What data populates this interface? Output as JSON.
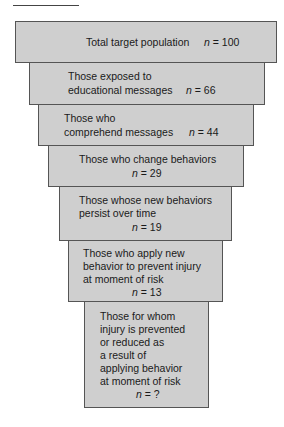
{
  "diagram": {
    "type": "funnel",
    "colors": {
      "box_fill": "#cfcfcf",
      "box_border": "#555555",
      "text": "#1a1a1a"
    },
    "stages": [
      {
        "label": "Total target population",
        "n_symbol": "n",
        "n_value": "= 100"
      },
      {
        "label_lines": [
          "Those exposed to",
          "educational messages"
        ],
        "n_symbol": "n",
        "n_value": "= 66"
      },
      {
        "label_lines": [
          "Those who",
          "comprehend messages"
        ],
        "n_symbol": "n",
        "n_value": "= 44"
      },
      {
        "label": "Those who change behaviors",
        "n_symbol": "n",
        "n_value": "= 29"
      },
      {
        "label_lines": [
          "Those whose new behaviors",
          "persist over time"
        ],
        "n_symbol": "n",
        "n_value": "= 19"
      },
      {
        "label_lines": [
          "Those who apply new",
          "behavior to prevent injury",
          "at moment of risk"
        ],
        "n_symbol": "n",
        "n_value": "= 13"
      },
      {
        "label_lines": [
          "Those for whom",
          "injury is prevented",
          "or reduced as",
          "a result of",
          "applying behavior",
          "at moment of risk"
        ],
        "n_symbol": "n",
        "n_value": "= ?"
      }
    ]
  }
}
